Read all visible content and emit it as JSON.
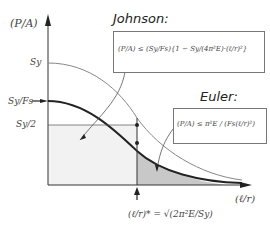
{
  "diagram": {
    "y_axis_label": "(P/A)",
    "x_axis_label": "(ℓ/r)",
    "ticks": {
      "sy": "Sy",
      "sy_over_fs": "Sy/Fs",
      "sy_half": "Sy/2"
    },
    "johnson": {
      "title": "Johnson:",
      "formula": "(P/A) ≤ (Sy/Fs){1 − Sy/(4π²E)·(ℓ/r)²}"
    },
    "euler": {
      "title": "Euler:",
      "formula": "(P/A) ≤ π²E / (Fs(ℓ/r)²)"
    },
    "critical": {
      "formula": "(ℓ/r)* = √(2π²E/Sy)"
    },
    "colors": {
      "shade": "#c8c8c8",
      "curve": "#333333",
      "thin_curve": "#888888"
    }
  }
}
